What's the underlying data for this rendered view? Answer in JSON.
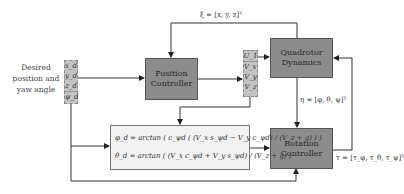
{
  "diagram": {
    "input_label": "Desired position and yaw angle",
    "input_stack": [
      "x_d",
      "y_d",
      "z_d",
      "ψ_d"
    ],
    "blocks": {
      "position_controller": "Position Controller",
      "quadrotor_dynamics": "Quadrotor Dynamics",
      "rotation_controller": "Rotation Controller"
    },
    "output_stack": [
      "U_1",
      "V_x",
      "V_y",
      "V_z"
    ],
    "signals": {
      "position_state": "ξ = [x, y, z]ᵀ",
      "attitude_state": "η = [φ, θ, ψ]ᵀ",
      "torque": "τ = [τ_φ, τ_θ, τ_ψ]ᵀ"
    },
    "formulas": {
      "phi_d": "φ_d = arctan ( c_ψd ( (V_x s_ψd − V_y c_ψd) / (V_z + g) ) )",
      "theta_d": "θ_d = arctan ( (V_x c_ψd + V_y s_ψd) / (V_z + g) )"
    }
  }
}
